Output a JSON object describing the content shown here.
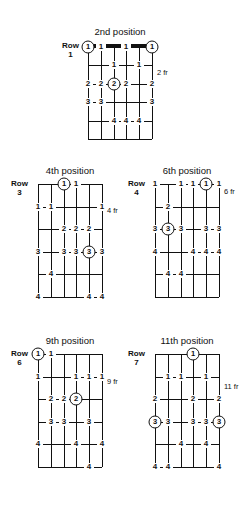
{
  "page": {
    "kind": "guitar-scale-position-diagrams",
    "string_count": 6,
    "fret_rows": 5
  },
  "diagrams": [
    {
      "id": "pos-2",
      "title": "2nd position",
      "row_word": "Row",
      "row_number": "1",
      "fret_label": "2 fr",
      "has_nut": true,
      "markers": [
        {
          "string": 1,
          "fret": 1,
          "label": "1",
          "circled": true
        },
        {
          "string": 2,
          "fret": 1,
          "label": "1",
          "circled": false
        },
        {
          "string": 4,
          "fret": 1,
          "label": "1",
          "circled": false
        },
        {
          "string": 6,
          "fret": 1,
          "label": "1",
          "circled": true
        },
        {
          "string": 3,
          "fret": 2,
          "label": "1",
          "circled": false
        },
        {
          "string": 5,
          "fret": 2,
          "label": "1",
          "circled": false
        },
        {
          "string": 1,
          "fret": 3,
          "label": "2",
          "circled": false
        },
        {
          "string": 2,
          "fret": 3,
          "label": "2",
          "circled": false
        },
        {
          "string": 3,
          "fret": 3,
          "label": "2",
          "circled": true
        },
        {
          "string": 4,
          "fret": 3,
          "label": "2",
          "circled": false
        },
        {
          "string": 6,
          "fret": 3,
          "label": "2",
          "circled": false
        },
        {
          "string": 1,
          "fret": 4,
          "label": "3",
          "circled": false
        },
        {
          "string": 2,
          "fret": 4,
          "label": "3",
          "circled": false
        },
        {
          "string": 6,
          "fret": 4,
          "label": "3",
          "circled": false
        },
        {
          "string": 3,
          "fret": 5,
          "label": "4",
          "circled": false
        },
        {
          "string": 4,
          "fret": 5,
          "label": "4",
          "circled": false
        },
        {
          "string": 5,
          "fret": 5,
          "label": "4",
          "circled": false
        }
      ]
    },
    {
      "id": "pos-4",
      "title": "4th position",
      "row_word": "Row",
      "row_number": "3",
      "fret_label": "4 fr",
      "has_nut": false,
      "markers": [
        {
          "string": 3,
          "fret": 1,
          "label": "1",
          "circled": true
        },
        {
          "string": 4,
          "fret": 1,
          "label": "1",
          "circled": false
        },
        {
          "string": 1,
          "fret": 2,
          "label": "1",
          "circled": false
        },
        {
          "string": 2,
          "fret": 2,
          "label": "1",
          "circled": false
        },
        {
          "string": 6,
          "fret": 2,
          "label": "1",
          "circled": false
        },
        {
          "string": 3,
          "fret": 3,
          "label": "2",
          "circled": false
        },
        {
          "string": 4,
          "fret": 3,
          "label": "2",
          "circled": false
        },
        {
          "string": 5,
          "fret": 3,
          "label": "2",
          "circled": false
        },
        {
          "string": 1,
          "fret": 4,
          "label": "3",
          "circled": false
        },
        {
          "string": 3,
          "fret": 4,
          "label": "3",
          "circled": false
        },
        {
          "string": 4,
          "fret": 4,
          "label": "3",
          "circled": false
        },
        {
          "string": 5,
          "fret": 4,
          "label": "3",
          "circled": true
        },
        {
          "string": 6,
          "fret": 4,
          "label": "3",
          "circled": false
        },
        {
          "string": 2,
          "fret": 5,
          "label": "4",
          "circled": false
        },
        {
          "string": 1,
          "fret": 6,
          "label": "4",
          "circled": false
        },
        {
          "string": 5,
          "fret": 6,
          "label": "4",
          "circled": false
        },
        {
          "string": 6,
          "fret": 6,
          "label": "4",
          "circled": false
        }
      ]
    },
    {
      "id": "pos-6",
      "title": "6th position",
      "row_word": "Row",
      "row_number": "4",
      "fret_label": "6 fr",
      "has_nut": false,
      "markers": [
        {
          "string": 1,
          "fret": 1,
          "label": "1",
          "circled": false
        },
        {
          "string": 3,
          "fret": 1,
          "label": "1",
          "circled": false
        },
        {
          "string": 4,
          "fret": 1,
          "label": "1",
          "circled": false
        },
        {
          "string": 5,
          "fret": 1,
          "label": "1",
          "circled": true
        },
        {
          "string": 6,
          "fret": 1,
          "label": "1",
          "circled": false
        },
        {
          "string": 2,
          "fret": 2,
          "label": "2",
          "circled": false
        },
        {
          "string": 1,
          "fret": 3,
          "label": "3",
          "circled": false
        },
        {
          "string": 2,
          "fret": 3,
          "label": "3",
          "circled": true
        },
        {
          "string": 3,
          "fret": 3,
          "label": "3",
          "circled": false
        },
        {
          "string": 5,
          "fret": 3,
          "label": "3",
          "circled": false
        },
        {
          "string": 6,
          "fret": 3,
          "label": "3",
          "circled": false
        },
        {
          "string": 1,
          "fret": 4,
          "label": "4",
          "circled": false
        },
        {
          "string": 4,
          "fret": 4,
          "label": "4",
          "circled": false
        },
        {
          "string": 5,
          "fret": 4,
          "label": "4",
          "circled": false
        },
        {
          "string": 6,
          "fret": 4,
          "label": "4",
          "circled": false
        },
        {
          "string": 2,
          "fret": 5,
          "label": "4",
          "circled": false
        },
        {
          "string": 3,
          "fret": 5,
          "label": "4",
          "circled": false
        }
      ]
    },
    {
      "id": "pos-9",
      "title": "9th position",
      "row_word": "Row",
      "row_number": "6",
      "fret_label": "9 fr",
      "has_nut": false,
      "markers": [
        {
          "string": 1,
          "fret": 1,
          "label": "1",
          "circled": true
        },
        {
          "string": 2,
          "fret": 1,
          "label": "1",
          "circled": false
        },
        {
          "string": 1,
          "fret": 2,
          "label": "1",
          "circled": false
        },
        {
          "string": 4,
          "fret": 2,
          "label": "1",
          "circled": false
        },
        {
          "string": 5,
          "fret": 2,
          "label": "1",
          "circled": false
        },
        {
          "string": 6,
          "fret": 2,
          "label": "1",
          "circled": false
        },
        {
          "string": 2,
          "fret": 3,
          "label": "2",
          "circled": false
        },
        {
          "string": 3,
          "fret": 3,
          "label": "2",
          "circled": false
        },
        {
          "string": 4,
          "fret": 3,
          "label": "2",
          "circled": true
        },
        {
          "string": 2,
          "fret": 4,
          "label": "3",
          "circled": false
        },
        {
          "string": 3,
          "fret": 4,
          "label": "3",
          "circled": false
        },
        {
          "string": 5,
          "fret": 4,
          "label": "3",
          "circled": false
        },
        {
          "string": 1,
          "fret": 5,
          "label": "4",
          "circled": false
        },
        {
          "string": 4,
          "fret": 5,
          "label": "4",
          "circled": false
        },
        {
          "string": 6,
          "fret": 5,
          "label": "4",
          "circled": false
        },
        {
          "string": 5,
          "fret": 6,
          "label": "4",
          "circled": false
        }
      ]
    },
    {
      "id": "pos-11",
      "title": "11th position",
      "row_word": "Row",
      "row_number": "7",
      "fret_label": "11 fr",
      "has_nut": false,
      "markers": [
        {
          "string": 4,
          "fret": 1,
          "label": "1",
          "circled": true
        },
        {
          "string": 2,
          "fret": 2,
          "label": "1",
          "circled": false
        },
        {
          "string": 3,
          "fret": 2,
          "label": "1",
          "circled": false
        },
        {
          "string": 5,
          "fret": 2,
          "label": "1",
          "circled": false
        },
        {
          "string": 1,
          "fret": 3,
          "label": "2",
          "circled": false
        },
        {
          "string": 4,
          "fret": 3,
          "label": "2",
          "circled": false
        },
        {
          "string": 6,
          "fret": 3,
          "label": "2",
          "circled": false
        },
        {
          "string": 1,
          "fret": 4,
          "label": "3",
          "circled": true
        },
        {
          "string": 2,
          "fret": 4,
          "label": "3",
          "circled": false
        },
        {
          "string": 4,
          "fret": 4,
          "label": "3",
          "circled": false
        },
        {
          "string": 5,
          "fret": 4,
          "label": "3",
          "circled": false
        },
        {
          "string": 6,
          "fret": 4,
          "label": "3",
          "circled": true
        },
        {
          "string": 3,
          "fret": 5,
          "label": "4",
          "circled": false
        },
        {
          "string": 5,
          "fret": 5,
          "label": "4",
          "circled": false
        },
        {
          "string": 1,
          "fret": 6,
          "label": "4",
          "circled": false
        },
        {
          "string": 2,
          "fret": 6,
          "label": "4",
          "circled": false
        },
        {
          "string": 6,
          "fret": 6,
          "label": "4",
          "circled": false
        }
      ]
    }
  ],
  "layout": {
    "boards": [
      {
        "id": "pos-2",
        "left": 88,
        "top": 47,
        "width": 64,
        "height": 92,
        "title_top": 26,
        "row_left": 62,
        "row_top": 42,
        "fret_left": 157,
        "fret_top": 69
      },
      {
        "id": "pos-4",
        "left": 38,
        "top": 184,
        "width": 64,
        "height": 113,
        "title_top": 165,
        "row_left": 11,
        "row_top": 180,
        "fret_left": 107,
        "fret_top": 207
      },
      {
        "id": "pos-6",
        "left": 155,
        "top": 184,
        "width": 64,
        "height": 113,
        "title_top": 165,
        "row_left": 128,
        "row_top": 180,
        "fret_left": 224,
        "fret_top": 188
      },
      {
        "id": "pos-9",
        "left": 38,
        "top": 354,
        "width": 64,
        "height": 113,
        "title_top": 335,
        "row_left": 11,
        "row_top": 350,
        "fret_left": 107,
        "fret_top": 378
      },
      {
        "id": "pos-11",
        "left": 155,
        "top": 354,
        "width": 64,
        "height": 113,
        "title_top": 335,
        "row_left": 128,
        "row_top": 350,
        "fret_left": 224,
        "fret_top": 383
      }
    ]
  }
}
